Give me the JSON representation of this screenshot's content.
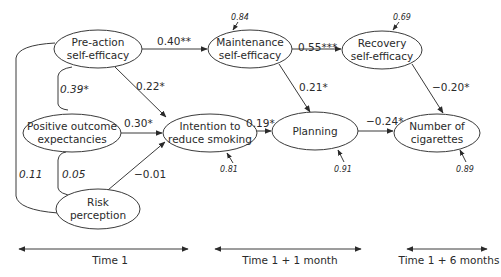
{
  "nodes": {
    "preaction": {
      "line1": "Pre-action",
      "line2": "self-efficacy"
    },
    "positive": {
      "line1": "Positive outcome",
      "line2": "expectancies"
    },
    "risk": {
      "line1": "Risk",
      "line2": "perception"
    },
    "intention": {
      "line1": "Intention to",
      "line2": "reduce smoking"
    },
    "maintenance": {
      "line1": "Maintenance",
      "line2": "self-efficacy"
    },
    "planning": {
      "line1": "Planning"
    },
    "recovery": {
      "line1": "Recovery",
      "line2": "self-efficacy"
    },
    "cigarettes": {
      "line1": "Number of",
      "line2": "cigarettes"
    }
  },
  "paths": {
    "preaction_to_maintenance": "0.40**",
    "preaction_to_intention": "0.22*",
    "positive_to_intention": "0.30*",
    "risk_to_intention": "−0.01",
    "intention_to_planning": "0.19*",
    "maintenance_to_recovery": "0.55***",
    "maintenance_to_planning": "0.21*",
    "planning_to_cigarettes": "−0.24*",
    "recovery_to_cigarettes": "−0.20*"
  },
  "covariances": {
    "preaction_positive": "0.39*",
    "positive_risk": "0.05",
    "preaction_risk": "0.11"
  },
  "residuals": {
    "maintenance": "0.84",
    "recovery": "0.69",
    "intention": "0.81",
    "planning": "0.91",
    "cigarettes": "0.89"
  },
  "timeline": {
    "t1": "Time 1",
    "t2": "Time 1 + 1 month",
    "t3": "Time 1 + 6 months"
  },
  "colors": {
    "stroke": "#3a3a3a",
    "text": "#2a2a2a",
    "background": "#ffffff"
  }
}
